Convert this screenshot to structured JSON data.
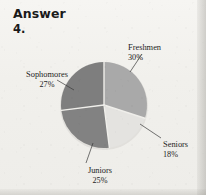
{
  "header": {
    "title": "Answer",
    "question_number": "4."
  },
  "chart_data": {
    "type": "pie",
    "title": "",
    "subtitle": "",
    "xlabel": "",
    "ylabel": "",
    "legend_position": "callout-labels",
    "grid": false,
    "center": {
      "cx": 104,
      "cy": 105
    },
    "radius": 43,
    "start_angle_deg": 0,
    "direction": "clockwise",
    "categories": [
      "Freshmen",
      "Seniors",
      "Juniors",
      "Sophomores"
    ],
    "values": [
      30,
      25,
      18,
      27
    ],
    "unit": "%",
    "slices": [
      {
        "label": "Freshmen",
        "value": 30,
        "value_text": "30%",
        "color": "#a9a9a9",
        "start_deg": 0,
        "end_deg": 108,
        "leader_from": {
          "x": 130,
          "y": 72
        },
        "leader_to": {
          "x": 142,
          "y": 54
        }
      },
      {
        "label": "Seniors",
        "value": 18,
        "value_text": "18%",
        "color": "#e4e3e0",
        "start_deg": 108,
        "end_deg": 172.8,
        "leader_from": {
          "x": 140,
          "y": 124
        },
        "leader_to": {
          "x": 161,
          "y": 138
        }
      },
      {
        "label": "Juniors",
        "value": 25,
        "value_text": "25%",
        "color": "#828282",
        "start_deg": 172.8,
        "end_deg": 262.8,
        "leader_from": {
          "x": 93,
          "y": 143
        },
        "leader_to": {
          "x": 86,
          "y": 163
        }
      },
      {
        "label": "Sophomores",
        "value": 27,
        "value_text": "27%",
        "color": "#7e7e7e",
        "start_deg": 262.8,
        "end_deg": 360,
        "leader_from": {
          "x": 74,
          "y": 90
        },
        "leader_to": {
          "x": 57,
          "y": 80
        }
      }
    ],
    "colors": {
      "freshmen": "#a9a9a9",
      "seniors": "#e4e3e0",
      "juniors": "#828282",
      "sophomores": "#7e7e7e",
      "separator": "#efeeea",
      "text": "#1d1d1d",
      "page_background": "#f2f1ee"
    }
  },
  "labels": {
    "freshmen_name": "Freshmen",
    "freshmen_pct": "30%",
    "seniors_name": "Seniors",
    "seniors_pct": "18%",
    "juniors_name": "Juniors",
    "juniors_pct": "25%",
    "sophomores_name": "Sophomores",
    "sophomores_pct": "27%"
  }
}
